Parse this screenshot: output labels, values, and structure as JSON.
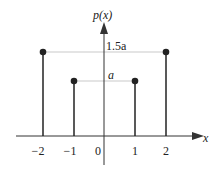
{
  "diagram": {
    "y_axis_label": "p(x)",
    "x_axis_label": "x",
    "tick_labels": [
      "-2",
      "-1",
      "0",
      "1",
      "2"
    ],
    "level_labels": {
      "high": "1.5a",
      "low": "a"
    },
    "stems": [
      {
        "x": -2,
        "height": "1.5a"
      },
      {
        "x": -1,
        "height": "a"
      },
      {
        "x": 1,
        "height": "a"
      },
      {
        "x": 2,
        "height": "1.5a"
      }
    ]
  }
}
